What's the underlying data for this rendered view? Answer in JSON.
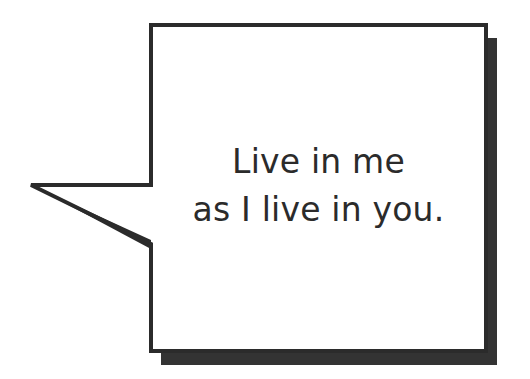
{
  "speech_bubble": {
    "lines": [
      "Live in me",
      "as I live in you."
    ],
    "colors": {
      "border": "#2b2b2b",
      "shadow": "#333333",
      "fill": "#ffffff",
      "text": "#2b2b2b"
    }
  }
}
